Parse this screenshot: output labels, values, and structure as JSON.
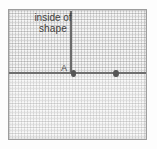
{
  "figure": {
    "annotation": {
      "line_1": "inside of",
      "line_2": "shape"
    },
    "point_label_a": "A",
    "colors": {
      "line": "#6f6f6f",
      "spike": "#6b6b6b",
      "dot": "#565656",
      "grid": "#969696",
      "frame": "#9d9d9d",
      "paper": "#f2f2f2",
      "text": "#3f3f3f"
    }
  },
  "chart_data": {
    "type": "scatter",
    "title": "",
    "xlabel": "",
    "ylabel": "",
    "grid": true,
    "legend": null,
    "xlim": [
      0,
      139
    ],
    "ylim": [
      0,
      131
    ],
    "elements": [
      {
        "kind": "horizontal-line",
        "label": "boundary-line",
        "y": 62,
        "x_start": 0,
        "x_end": 139,
        "color": "#6f6f6f"
      },
      {
        "kind": "vertical-line",
        "label": "spike-at-A",
        "x": 61,
        "y_start": 1,
        "y_end": 64,
        "color": "#6b6b6b"
      }
    ],
    "points": [
      {
        "label": "A",
        "x": 61.5,
        "y": 62
      },
      {
        "label": "",
        "x": 104,
        "y": 62
      }
    ],
    "annotations": [
      {
        "text": "inside of shape",
        "x": 7,
        "y": 2
      },
      {
        "text": "A",
        "x": 52,
        "y": 54
      }
    ]
  }
}
